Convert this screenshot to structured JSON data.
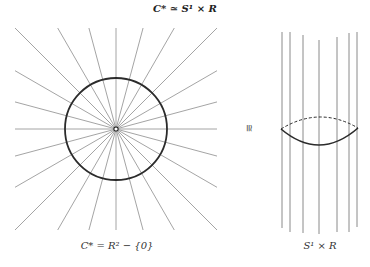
{
  "title": "C* ≃ S¹ × R",
  "left_diagram": {
    "caption": "C* = R² − {0}",
    "center": [
      116,
      129
    ],
    "circle_radius": 51,
    "ray_count": 24,
    "ray_half_extent": 101,
    "colors": {
      "rays": "#9a9a9a",
      "circle": "#2b2b2b"
    }
  },
  "iso_symbol": "≅",
  "right_diagram": {
    "caption": "S¹ × R",
    "lines": [
      {
        "x": 282,
        "y1": 32,
        "y2": 228
      },
      {
        "x": 290,
        "y1": 32,
        "y2": 232
      },
      {
        "x": 303,
        "y1": 35,
        "y2": 233
      },
      {
        "x": 319,
        "y1": 40,
        "y2": 234
      },
      {
        "x": 337,
        "y1": 37,
        "y2": 232
      },
      {
        "x": 349,
        "y1": 33,
        "y2": 232
      },
      {
        "x": 357,
        "y1": 32,
        "y2": 227
      }
    ],
    "ellipse": {
      "left": [
        281,
        129
      ],
      "right": [
        358,
        128
      ],
      "top_y": 117,
      "bottom_y": 145
    },
    "colors": {
      "lines": "#8a8a8a",
      "ellipse": "#2b2b2b"
    }
  }
}
